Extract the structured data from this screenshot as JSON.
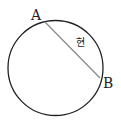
{
  "diagram": {
    "point_a": "A",
    "point_b": "B",
    "chord_label": "현",
    "circle": {
      "cx": 55.5,
      "cy": 68,
      "r": 47.5,
      "stroke": "#222222"
    },
    "chord": {
      "x1": 45,
      "y1": 22,
      "x2": 100,
      "y2": 78,
      "stroke": "#888888"
    }
  }
}
